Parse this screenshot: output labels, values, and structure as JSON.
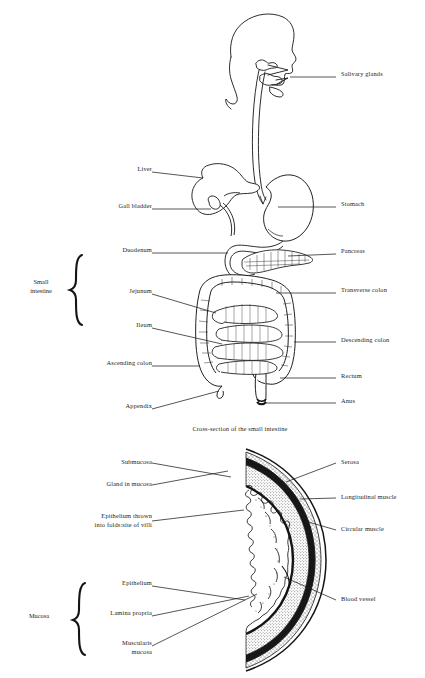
{
  "figure": {
    "caption": "Cross-section of the small intestine",
    "ink_color": "#151515",
    "background_color": "#ffffff"
  },
  "upper_diagram": {
    "name": "digestive-tract-overview",
    "left_labels": [
      {
        "id": "liver",
        "text": "Liver",
        "x": 118,
        "y": 169,
        "leader_to_x": 203,
        "leader_to_y": 178
      },
      {
        "id": "gall-bladder",
        "text": "Gall bladder",
        "x": 141,
        "y": 205,
        "leader_to_x": 213,
        "leader_to_y": 210
      },
      {
        "id": "duodenum",
        "text": "Duodenum",
        "x": 136,
        "y": 251,
        "leader_to_x": 228,
        "leader_to_y": 253
      },
      {
        "id": "jejunum",
        "text": "Jejunum",
        "x": 130,
        "y": 291,
        "leader_to_x": 215,
        "leader_to_y": 312
      },
      {
        "id": "ileum",
        "text": "Ileum",
        "x": 125,
        "y": 325,
        "leader_to_x": 222,
        "leader_to_y": 343
      },
      {
        "id": "ascending-colon",
        "text": "Ascending colon",
        "x": 157,
        "y": 364,
        "leader_to_x": 200,
        "leader_to_y": 365
      },
      {
        "id": "appendix",
        "text": "Appendix",
        "x": 130,
        "y": 407,
        "leader_to_x": 218,
        "leader_to_y": 390
      }
    ],
    "right_labels": [
      {
        "id": "salivary-glands",
        "text": "Salivary glands",
        "x": 341,
        "y": 74,
        "leader_to_x": 288,
        "leader_to_y": 78
      },
      {
        "id": "stomach",
        "text": "Stomach",
        "x": 341,
        "y": 204,
        "leader_to_x": 277,
        "leader_to_y": 206
      },
      {
        "id": "pancreas",
        "text": "Pancreas",
        "x": 341,
        "y": 251,
        "leader_to_x": 284,
        "leader_to_y": 256
      },
      {
        "id": "transverse-colon",
        "text": "Transverse colon",
        "x": 341,
        "y": 290,
        "leader_to_x": 275,
        "leader_to_y": 292
      },
      {
        "id": "descending-colon",
        "text": "Descending colon",
        "x": 341,
        "y": 340,
        "leader_to_x": 292,
        "leader_to_y": 341
      },
      {
        "id": "rectum",
        "text": "Rectum",
        "x": 341,
        "y": 376,
        "leader_to_x": 278,
        "leader_to_y": 377
      },
      {
        "id": "anus",
        "text": "Anus",
        "x": 341,
        "y": 400,
        "leader_to_x": 262,
        "leader_to_y": 401
      }
    ],
    "bracket_label": {
      "id": "small-intestine",
      "text": "Small\nintestine",
      "x": 20,
      "y": 282
    }
  },
  "lower_diagram": {
    "name": "intestine-cross-section",
    "left_labels": [
      {
        "id": "submucosa",
        "text": "Submucosa",
        "x": 91,
        "y": 461,
        "leader_to_x": 228,
        "leader_to_y": 475
      },
      {
        "id": "gland-in-mucosa",
        "text": "Gland in mucosa",
        "x": 80,
        "y": 483,
        "leader_to_x": 225,
        "leader_to_y": 470
      },
      {
        "id": "epithelium-folds",
        "text": "Epithelium thrown\ninto folds:site of villi",
        "x": 73,
        "y": 518,
        "leader_to_x": 241,
        "leader_to_y": 509
      },
      {
        "id": "epithelium",
        "text": "Epithelium",
        "x": 103,
        "y": 583,
        "leader_to_x": 243,
        "leader_to_y": 598
      },
      {
        "id": "lamina-propria",
        "text": "Lamina propria",
        "x": 88,
        "y": 613,
        "leader_to_x": 247,
        "leader_to_y": 595
      },
      {
        "id": "muscularis-mucosa",
        "text": "Muscularis\nmucosa",
        "x": 103,
        "y": 645,
        "leader_to_x": 255,
        "leader_to_y": 593
      }
    ],
    "right_labels": [
      {
        "id": "serosa",
        "text": "Serosa",
        "x": 341,
        "y": 461,
        "leader_to_x": 281,
        "leader_to_y": 480
      },
      {
        "id": "longitudinal-muscle",
        "text": "Longitudinal muscle",
        "x": 341,
        "y": 496,
        "leader_to_x": 296,
        "leader_to_y": 497
      },
      {
        "id": "circular-muscle",
        "text": "Circular muscle",
        "x": 341,
        "y": 528,
        "leader_to_x": 300,
        "leader_to_y": 520
      },
      {
        "id": "blood-vessel",
        "text": "Blood vessel",
        "x": 341,
        "y": 598,
        "leader_to_x": 279,
        "leader_to_y": 575
      }
    ],
    "bracket_label": {
      "id": "mucosa",
      "text": "Mucosa",
      "x": 24,
      "y": 615
    }
  }
}
